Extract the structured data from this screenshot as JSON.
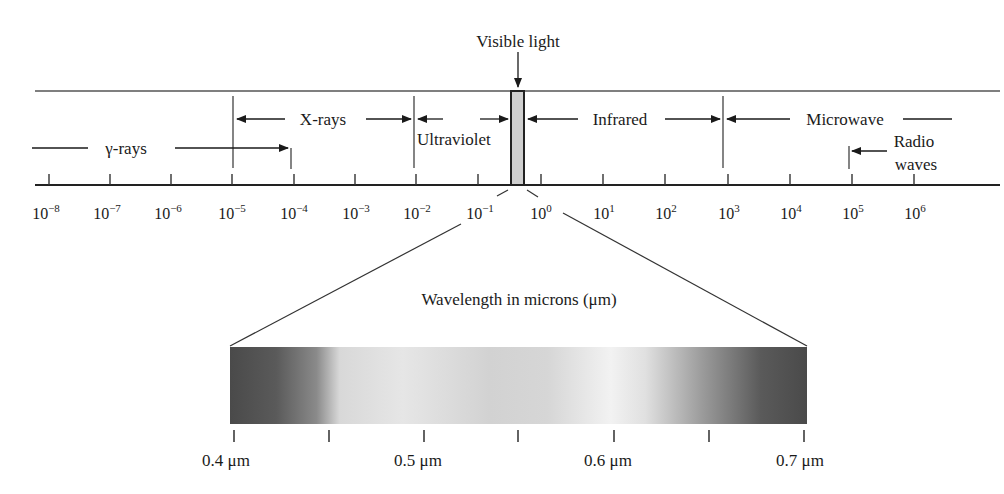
{
  "figure": {
    "visible_light_label": "Visible light",
    "bands": {
      "gamma": "γ-rays",
      "xray": "X-rays",
      "uv": "Ultraviolet",
      "ir": "Infrared",
      "microwave": "Microwave",
      "radio_line1": "Radio",
      "radio_line2": "waves"
    },
    "axis_ticks": [
      {
        "base": "10",
        "exp": "−8"
      },
      {
        "base": "10",
        "exp": "−7"
      },
      {
        "base": "10",
        "exp": "−6"
      },
      {
        "base": "10",
        "exp": "−5"
      },
      {
        "base": "10",
        "exp": "−4"
      },
      {
        "base": "10",
        "exp": "−3"
      },
      {
        "base": "10",
        "exp": "−2"
      },
      {
        "base": "10",
        "exp": "−1"
      },
      {
        "base": "10",
        "exp": "0"
      },
      {
        "base": "10",
        "exp": "1"
      },
      {
        "base": "10",
        "exp": "2"
      },
      {
        "base": "10",
        "exp": "3"
      },
      {
        "base": "10",
        "exp": "4"
      },
      {
        "base": "10",
        "exp": "5"
      },
      {
        "base": "10",
        "exp": "6"
      }
    ],
    "zoom_title": "Wavelength in microns (μm)",
    "spectrum_ticks": [
      "0.4 μm",
      "0.5 μm",
      "0.6 μm",
      "0.7 μm"
    ],
    "colors": {
      "line": "#333333",
      "visible_band_fill": "#cfcfcf"
    }
  }
}
